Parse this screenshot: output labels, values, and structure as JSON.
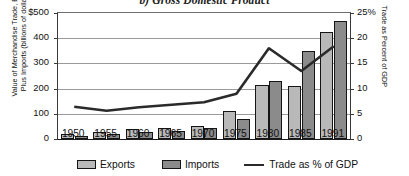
{
  "chart_data": {
    "type": "bar",
    "title": "b) Gross Domestic Product",
    "xlabel": "",
    "ylabel": "Value of Merchandise Trade, Exports Plus Imports (billions of dollars)",
    "y2label": "Trade as Percent of GDP",
    "categories": [
      "1950",
      "1955",
      "1960",
      "1965",
      "1970",
      "1975",
      "1980",
      "1985",
      "1991"
    ],
    "ylim": [
      0,
      500
    ],
    "y2lim": [
      0,
      25
    ],
    "yticks": [
      "0",
      "100",
      "200",
      "300",
      "400",
      "$500"
    ],
    "ytick_values": [
      0,
      100,
      200,
      300,
      400,
      500
    ],
    "y2ticks": [
      "0",
      "5",
      "10",
      "15",
      "20",
      "25%"
    ],
    "y2tick_values": [
      0,
      5,
      10,
      15,
      20,
      25
    ],
    "grid": true,
    "legend_position": "bottom",
    "series": [
      {
        "name": "Exports",
        "type": "bar",
        "axis": "left",
        "color": "#b9b9b9",
        "values": [
          20,
          26,
          40,
          45,
          52,
          110,
          215,
          210,
          425
        ]
      },
      {
        "name": "Imports",
        "type": "bar",
        "axis": "left",
        "color": "#8b8b8b",
        "values": [
          12,
          18,
          27,
          32,
          43,
          80,
          230,
          350,
          470
        ]
      },
      {
        "name": "Trade as % of GDP",
        "type": "line",
        "axis": "right",
        "color": "#2a2a2a",
        "values": [
          6.4,
          5.6,
          6.3,
          6.8,
          7.3,
          9.0,
          18.0,
          13.5,
          18.4
        ]
      }
    ]
  },
  "legend": {
    "exports_label": "Exports",
    "imports_label": "Imports",
    "trade_label": "Trade as % of GDP"
  },
  "axes": {
    "left_caption_line1": "Value of Merchandise Trade, Exports",
    "left_caption_line2": "Plus Imports (billions of dollars)",
    "right_caption": "Trade as Percent of GDP"
  }
}
